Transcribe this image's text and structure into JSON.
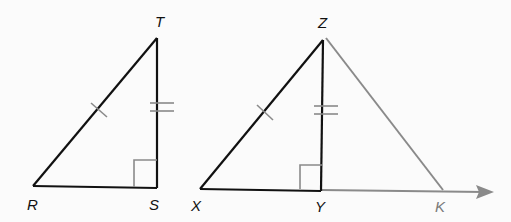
{
  "diagram": {
    "colors": {
      "background": "#fbfbfb",
      "primary_line": "#111111",
      "secondary_line": "#8a8a8a",
      "label_primary": "#111111",
      "label_secondary": "#7a7a7a"
    },
    "triangle_rst": {
      "labels": {
        "R": "R",
        "S": "S",
        "T": "T"
      },
      "marks": {
        "RT": "single tick",
        "ST": "double tick",
        "S": "right angle"
      }
    },
    "triangle_xyz": {
      "labels": {
        "X": "X",
        "Y": "Y",
        "Z": "Z"
      },
      "marks": {
        "XZ": "single tick",
        "YZ": "double tick",
        "Y": "right angle"
      }
    },
    "extension": {
      "labels": {
        "K": "K"
      },
      "elements": [
        "segment ZK",
        "ray from Y through K"
      ]
    }
  }
}
